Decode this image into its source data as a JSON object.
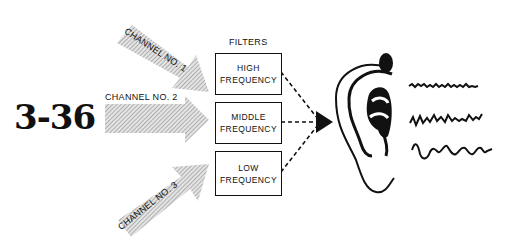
{
  "figure": {
    "number": "3-36"
  },
  "channels": [
    {
      "label": "CHANNEL NO. 1",
      "target": "high"
    },
    {
      "label": "CHANNEL NO. 2",
      "target": "middle"
    },
    {
      "label": "CHANNEL NO. 3",
      "target": "low"
    }
  ],
  "filters": {
    "heading": "FILTERS",
    "boxes": [
      {
        "line1": "HIGH",
        "line2": "FREQUENCY"
      },
      {
        "line1": "MIDDLE",
        "line2": "FREQUENCY"
      },
      {
        "line1": "LOW",
        "line2": "FREQUENCY"
      }
    ]
  },
  "output": {
    "receiver": "ear",
    "waveforms": [
      "high-frequency-wave",
      "middle-frequency-wave",
      "low-frequency-wave"
    ]
  },
  "colors": {
    "ink": "#111111",
    "hatch": "#9a9a9a",
    "background": "#ffffff"
  }
}
